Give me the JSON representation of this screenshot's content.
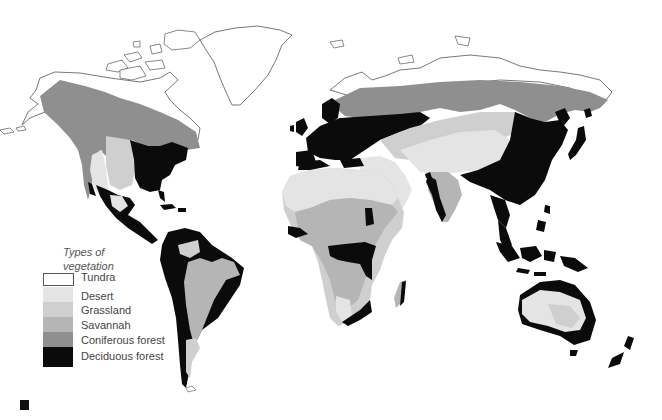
{
  "map": {
    "type": "world vegetation map",
    "colors": {
      "tundra": "#ffffff",
      "desert": "#e4e4e4",
      "grassland": "#cfcfcf",
      "savannah": "#b5b5b5",
      "coniferous_forest": "#8f8f8f",
      "deciduous_forest": "#0b0b0b",
      "outline": "#555555"
    }
  },
  "legend": {
    "title_line1": "Types of",
    "title_line2": "vegetation",
    "items": [
      {
        "label": "Tundra",
        "color": "#ffffff"
      },
      {
        "label": "Desert",
        "color": "#e4e4e4"
      },
      {
        "label": "Grassland",
        "color": "#cfcfcf"
      },
      {
        "label": "Savannah",
        "color": "#b5b5b5"
      },
      {
        "label": "Coniferous forest",
        "color": "#8f8f8f"
      },
      {
        "label": "Deciduous forest",
        "color": "#0b0b0b"
      }
    ]
  }
}
